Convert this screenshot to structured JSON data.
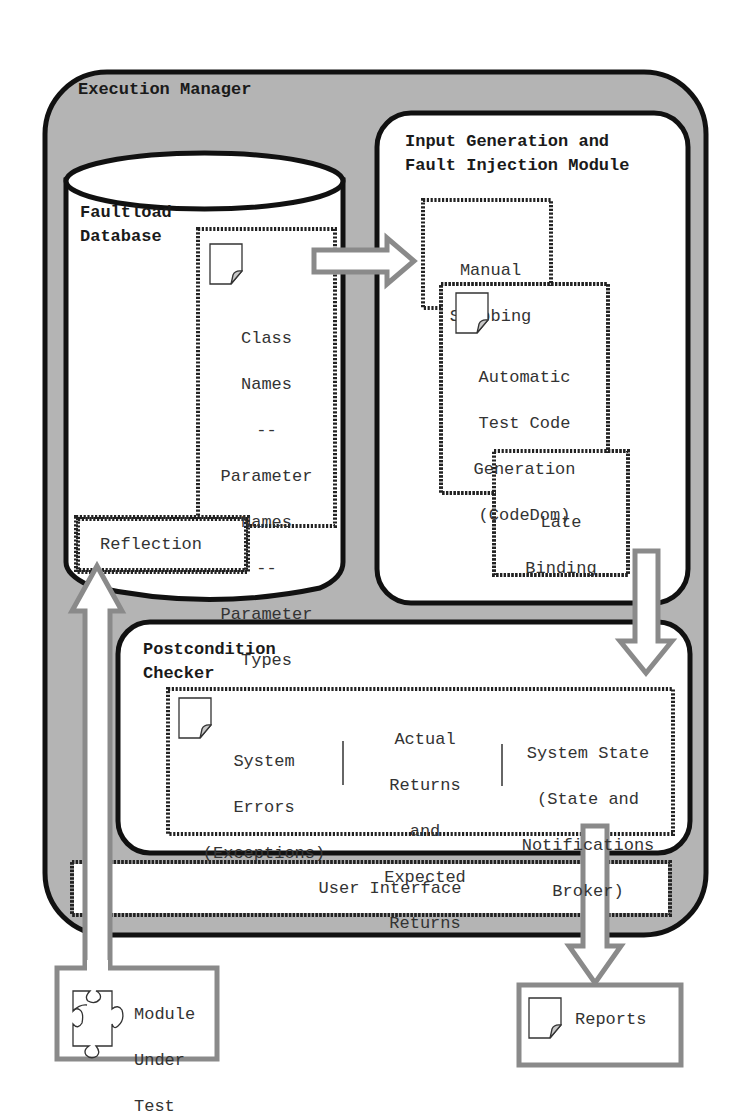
{
  "diagram": {
    "colors": {
      "outer_fill": "#b4b4b4",
      "box_fill": "#ffffff",
      "stroke": "#111111",
      "arrow_stroke": "#8a8a8a",
      "text": "#333333"
    },
    "execution_manager": {
      "title": "Execution Manager"
    },
    "faultload_database": {
      "title_line1": "Faultload",
      "title_line2": "Database",
      "metadata_box": {
        "icon": "document-icon",
        "lines": [
          "Class",
          "Names",
          "--",
          "Parameter",
          "Names",
          "--",
          "Parameter",
          "Types"
        ]
      },
      "reflection": {
        "label": "Reflection"
      }
    },
    "input_module": {
      "title_line1": "Input Generation and",
      "title_line2": "Fault Injection Module",
      "manual_stubbing": {
        "line1": "Manual",
        "line2": "Stubbing"
      },
      "automatic_generation": {
        "icon": "document-icon",
        "line1": "Automatic",
        "line2": "Test Code",
        "line3": "Generation",
        "line4": "(CodeDom)"
      },
      "late_binding": {
        "line1": "Late",
        "line2": "Binding"
      }
    },
    "postcondition_checker": {
      "title_line1": "Postcondition",
      "title_line2": "Checker",
      "icon": "document-icon",
      "columns": [
        {
          "lines": [
            "System",
            "Errors",
            "(Exceptions)"
          ]
        },
        {
          "lines": [
            "Actual",
            "Returns",
            "and",
            "Expected",
            "Returns"
          ]
        },
        {
          "lines": [
            "System State",
            "(State and",
            "Notifications",
            "Broker)"
          ]
        }
      ]
    },
    "user_interface": {
      "label": "User Interface"
    },
    "module_under_test": {
      "icon": "puzzle-piece-icon",
      "line1": "Module",
      "line2": "Under",
      "line3": "Test"
    },
    "reports": {
      "icon": "document-icon",
      "label": "Reports"
    }
  }
}
